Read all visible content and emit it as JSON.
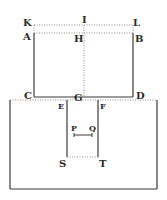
{
  "diagram": {
    "type": "geometric figure",
    "colors": {
      "ink": "#3a3a3a",
      "dotted": "#8a8a8a",
      "background": "#ffffff"
    },
    "labels": {
      "K": "K",
      "I": "I",
      "L": "L",
      "A": "A",
      "H": "H",
      "B": "B",
      "C": "C",
      "G": "G",
      "D": "D",
      "E": "E",
      "F": "F",
      "P": "P",
      "Q": "Q",
      "S": "S",
      "T": "T"
    },
    "segments": [
      {
        "from": "K",
        "to": "L",
        "style": "dotted"
      },
      {
        "from": "A",
        "to": "B",
        "style": "dotted"
      },
      {
        "from": "A",
        "to": "C",
        "style": "solid"
      },
      {
        "from": "B",
        "to": "D",
        "style": "solid"
      },
      {
        "from": "I",
        "to": "G",
        "style": "dotted"
      },
      {
        "from": "C",
        "to": "D",
        "style": "solid"
      },
      {
        "from": "E",
        "to": "S",
        "style": "solid"
      },
      {
        "from": "F",
        "to": "T",
        "style": "solid"
      },
      {
        "from": "S",
        "to": "T",
        "style": "dotted"
      },
      {
        "from": "P",
        "to": "Q",
        "style": "solid"
      }
    ]
  }
}
